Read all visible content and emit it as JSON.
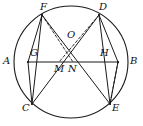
{
  "figure": {
    "type": "geometry-diagram",
    "stroke_color": "#1a1a1a",
    "background_color": "#ffffff",
    "circle": {
      "cx": 71,
      "cy": 62,
      "rx": 57,
      "ry": 56
    },
    "points": [
      {
        "id": "A",
        "label": "A",
        "x": 28,
        "y": 62,
        "label_x": 3,
        "label_y": 56
      },
      {
        "id": "B",
        "label": "B",
        "x": 118,
        "y": 62,
        "label_x": 130,
        "label_y": 56
      },
      {
        "id": "C",
        "label": "C",
        "x": 32,
        "y": 104,
        "label_x": 22,
        "label_y": 103
      },
      {
        "id": "D",
        "label": "D",
        "x": 99,
        "y": 15,
        "label_x": 99,
        "label_y": 2
      },
      {
        "id": "E",
        "label": "E",
        "x": 110,
        "y": 104,
        "label_x": 112,
        "label_y": 103
      },
      {
        "id": "F",
        "label": "F",
        "x": 42,
        "y": 15,
        "label_x": 40,
        "label_y": 2
      },
      {
        "id": "G",
        "label": "G",
        "x": 37,
        "y": 62,
        "label_x": 30,
        "label_y": 48
      },
      {
        "id": "H",
        "label": "H",
        "x": 106,
        "y": 62,
        "label_x": 100,
        "label_y": 48
      },
      {
        "id": "M",
        "label": "M",
        "x": 59,
        "y": 62,
        "label_x": 54,
        "label_y": 64
      },
      {
        "id": "N",
        "label": "N",
        "x": 73,
        "y": 62,
        "label_x": 68,
        "label_y": 64
      },
      {
        "id": "O",
        "label": "O",
        "x": 71,
        "y": 44,
        "label_x": 67,
        "label_y": 30
      }
    ],
    "solid_segments": [
      {
        "from": "A",
        "to": "B",
        "name": "chord-a-b"
      },
      {
        "from": "A",
        "to": "F",
        "name": "segment-a-f"
      },
      {
        "from": "A",
        "to": "C",
        "name": "segment-a-c"
      },
      {
        "from": "B",
        "to": "D",
        "name": "segment-b-d"
      },
      {
        "from": "B",
        "to": "E",
        "name": "segment-b-e"
      },
      {
        "from": "F",
        "to": "C",
        "name": "segment-f-c"
      },
      {
        "from": "D",
        "to": "E",
        "name": "segment-d-e"
      },
      {
        "from": "F",
        "to": "E",
        "name": "diagonal-f-e"
      },
      {
        "from": "D",
        "to": "C",
        "name": "diagonal-d-c"
      }
    ],
    "dashed_segments": [
      {
        "from": "F",
        "to": "N",
        "name": "dashed-f-n"
      },
      {
        "from": "D",
        "to": "M",
        "name": "dashed-d-m"
      },
      {
        "from": "B",
        "to": "E",
        "name": "dashed-b-e"
      }
    ]
  }
}
